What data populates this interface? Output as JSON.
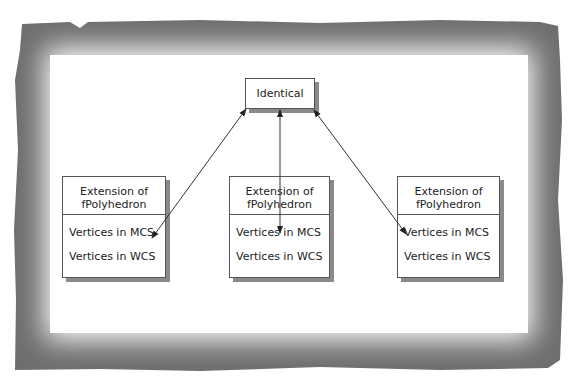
{
  "diagram": {
    "top_node": {
      "label": "Identical"
    },
    "nodes": [
      {
        "title_line1": "Extension of",
        "title_line2": "fPolyhedron",
        "attr1": "Vertices in MCS",
        "attr2": "Vertices in WCS"
      },
      {
        "title_line1": "Extension of",
        "title_line2": "fPolyhedron",
        "attr1": "Vertices in MCS",
        "attr2": "Vertices in WCS"
      },
      {
        "title_line1": "Extension of",
        "title_line2": "fPolyhedron",
        "attr1": "Vertices in MCS",
        "attr2": "Vertices in WCS"
      }
    ],
    "edges": [
      {
        "from": "Identical",
        "to": "node0.Vertices in MCS",
        "type": "bidirectional-arrow"
      },
      {
        "from": "Identical",
        "to": "node1.Vertices in MCS",
        "type": "bidirectional-arrow"
      },
      {
        "from": "Identical",
        "to": "node2.Vertices in MCS",
        "type": "bidirectional-arrow"
      }
    ],
    "colors": {
      "frame": "#7a7a7a",
      "box_border": "#555555",
      "shadow": "#8a8a8a",
      "text": "#222222"
    }
  }
}
